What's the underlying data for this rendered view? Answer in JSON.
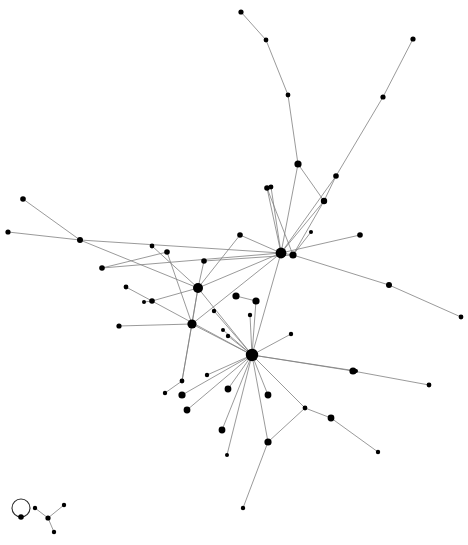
{
  "figure": {
    "type": "node-link-diagram",
    "width": 468,
    "height": 545,
    "background_color": "#ffffff",
    "node_color": "#000000",
    "edge_color": "#808080",
    "selfloop_color": "#2b2b2b",
    "edge_width": 0.8,
    "node_count": 60,
    "edge_count": 66,
    "component_count": 3,
    "layout": "force-directed"
  },
  "chart_data": {
    "type": "scatter",
    "xlabel": "",
    "ylabel": "",
    "xlim": [
      0,
      468
    ],
    "ylim": [
      0,
      545
    ],
    "grid": false,
    "legend": "none",
    "nodes": [
      {
        "id": "n0",
        "x": 241,
        "y": 12,
        "r": 2.6,
        "degree": 1
      },
      {
        "id": "n1",
        "x": 266,
        "y": 40,
        "r": 2.4,
        "degree": 2
      },
      {
        "id": "n2",
        "x": 288,
        "y": 95,
        "r": 2.4,
        "degree": 2
      },
      {
        "id": "n3",
        "x": 298,
        "y": 164,
        "r": 3.6,
        "degree": 3
      },
      {
        "id": "n4",
        "x": 413,
        "y": 39,
        "r": 2.6,
        "degree": 1
      },
      {
        "id": "n5",
        "x": 383,
        "y": 97,
        "r": 2.6,
        "degree": 2
      },
      {
        "id": "n6",
        "x": 336,
        "y": 176,
        "r": 2.8,
        "degree": 2
      },
      {
        "id": "n7",
        "x": 324,
        "y": 201,
        "r": 3.2,
        "degree": 3
      },
      {
        "id": "n8",
        "x": 267,
        "y": 188,
        "r": 2.8,
        "degree": 2
      },
      {
        "id": "n9",
        "x": 281,
        "y": 253,
        "r": 5.4,
        "degree": 9
      },
      {
        "id": "n10",
        "x": 293,
        "y": 255,
        "r": 3.6,
        "degree": 4
      },
      {
        "id": "n11",
        "x": 240,
        "y": 235,
        "r": 2.8,
        "degree": 2
      },
      {
        "id": "n12",
        "x": 360,
        "y": 235,
        "r": 2.8,
        "degree": 1
      },
      {
        "id": "n13",
        "x": 389,
        "y": 285,
        "r": 3.0,
        "degree": 2
      },
      {
        "id": "n14",
        "x": 461,
        "y": 317,
        "r": 2.4,
        "degree": 1
      },
      {
        "id": "n15",
        "x": 23,
        "y": 199,
        "r": 2.8,
        "degree": 1
      },
      {
        "id": "n16",
        "x": 8,
        "y": 232,
        "r": 2.6,
        "degree": 1
      },
      {
        "id": "n17",
        "x": 80,
        "y": 240,
        "r": 3.0,
        "degree": 3
      },
      {
        "id": "n18",
        "x": 102,
        "y": 268,
        "r": 2.8,
        "degree": 2
      },
      {
        "id": "n19",
        "x": 152,
        "y": 246,
        "r": 2.4,
        "degree": 1
      },
      {
        "id": "n20",
        "x": 167,
        "y": 252,
        "r": 2.8,
        "degree": 2
      },
      {
        "id": "n21",
        "x": 204,
        "y": 261,
        "r": 2.8,
        "degree": 2
      },
      {
        "id": "n22",
        "x": 198,
        "y": 288,
        "r": 5.0,
        "degree": 8
      },
      {
        "id": "n23",
        "x": 126,
        "y": 287,
        "r": 2.4,
        "degree": 1
      },
      {
        "id": "n24",
        "x": 152,
        "y": 301,
        "r": 2.8,
        "degree": 3
      },
      {
        "id": "n25",
        "x": 119,
        "y": 326,
        "r": 2.6,
        "degree": 1
      },
      {
        "id": "n26",
        "x": 192,
        "y": 324,
        "r": 4.6,
        "degree": 5
      },
      {
        "id": "n27",
        "x": 236,
        "y": 296,
        "r": 3.6,
        "degree": 1
      },
      {
        "id": "n28",
        "x": 256,
        "y": 301,
        "r": 3.6,
        "degree": 2
      },
      {
        "id": "n29",
        "x": 250,
        "y": 315,
        "r": 2.2,
        "degree": 1
      },
      {
        "id": "n30",
        "x": 252,
        "y": 355,
        "r": 6.2,
        "degree": 17
      },
      {
        "id": "n31",
        "x": 228,
        "y": 336,
        "r": 2.2,
        "degree": 1
      },
      {
        "id": "n32",
        "x": 223,
        "y": 330,
        "r": 2.0,
        "degree": 1
      },
      {
        "id": "n33",
        "x": 291,
        "y": 334,
        "r": 2.2,
        "degree": 1
      },
      {
        "id": "n34",
        "x": 353,
        "y": 371,
        "r": 3.6,
        "degree": 2
      },
      {
        "id": "n35",
        "x": 429,
        "y": 385,
        "r": 2.4,
        "degree": 1
      },
      {
        "id": "n36",
        "x": 182,
        "y": 381,
        "r": 2.4,
        "degree": 2
      },
      {
        "id": "n37",
        "x": 165,
        "y": 393,
        "r": 2.2,
        "degree": 1
      },
      {
        "id": "n38",
        "x": 182,
        "y": 395,
        "r": 3.6,
        "degree": 1
      },
      {
        "id": "n39",
        "x": 187,
        "y": 410,
        "r": 3.4,
        "degree": 1
      },
      {
        "id": "n40",
        "x": 222,
        "y": 430,
        "r": 3.4,
        "degree": 1
      },
      {
        "id": "n41",
        "x": 228,
        "y": 389,
        "r": 3.4,
        "degree": 1
      },
      {
        "id": "n42",
        "x": 268,
        "y": 395,
        "r": 3.4,
        "degree": 1
      },
      {
        "id": "n43",
        "x": 268,
        "y": 442,
        "r": 3.6,
        "degree": 3
      },
      {
        "id": "n44",
        "x": 305,
        "y": 408,
        "r": 2.4,
        "degree": 2
      },
      {
        "id": "n45",
        "x": 331,
        "y": 418,
        "r": 3.4,
        "degree": 2
      },
      {
        "id": "n46",
        "x": 378,
        "y": 452,
        "r": 2.2,
        "degree": 1
      },
      {
        "id": "n47",
        "x": 243,
        "y": 508,
        "r": 2.2,
        "degree": 1
      },
      {
        "id": "n48",
        "x": 207,
        "y": 375,
        "r": 2.2,
        "degree": 1
      },
      {
        "id": "n49",
        "x": 214,
        "y": 311,
        "r": 2.2,
        "degree": 1
      },
      {
        "id": "n50",
        "x": 144,
        "y": 302,
        "r": 2.0,
        "degree": 1
      },
      {
        "id": "n51",
        "x": 271,
        "y": 187,
        "r": 2.4,
        "degree": 1
      },
      {
        "id": "n52",
        "x": 311,
        "y": 232,
        "r": 2.0,
        "degree": 1
      },
      {
        "id": "n53",
        "x": 356,
        "y": 371,
        "r": 2.0,
        "degree": 1
      },
      {
        "id": "n54",
        "x": 21,
        "y": 517,
        "r": 2.8,
        "degree": 2
      },
      {
        "id": "n55",
        "x": 48,
        "y": 518,
        "r": 2.6,
        "degree": 3
      },
      {
        "id": "n56",
        "x": 35,
        "y": 508,
        "r": 2.2,
        "degree": 1
      },
      {
        "id": "n57",
        "x": 64,
        "y": 505,
        "r": 2.2,
        "degree": 1
      },
      {
        "id": "n58",
        "x": 54,
        "y": 532,
        "r": 2.2,
        "degree": 1
      },
      {
        "id": "n59",
        "x": 227,
        "y": 455,
        "r": 2.0,
        "degree": 1
      }
    ],
    "edges": [
      {
        "source": "n0",
        "target": "n1"
      },
      {
        "source": "n1",
        "target": "n2"
      },
      {
        "source": "n2",
        "target": "n3"
      },
      {
        "source": "n3",
        "target": "n9"
      },
      {
        "source": "n3",
        "target": "n7"
      },
      {
        "source": "n4",
        "target": "n5"
      },
      {
        "source": "n5",
        "target": "n6"
      },
      {
        "source": "n6",
        "target": "n7"
      },
      {
        "source": "n6",
        "target": "n9"
      },
      {
        "source": "n7",
        "target": "n9"
      },
      {
        "source": "n7",
        "target": "n10"
      },
      {
        "source": "n8",
        "target": "n9"
      },
      {
        "source": "n8",
        "target": "n10"
      },
      {
        "source": "n9",
        "target": "n10"
      },
      {
        "source": "n9",
        "target": "n11"
      },
      {
        "source": "n9",
        "target": "n17"
      },
      {
        "source": "n9",
        "target": "n22"
      },
      {
        "source": "n9",
        "target": "n26"
      },
      {
        "source": "n9",
        "target": "n30"
      },
      {
        "source": "n10",
        "target": "n13"
      },
      {
        "source": "n10",
        "target": "n21"
      },
      {
        "source": "n13",
        "target": "n14"
      },
      {
        "source": "n11",
        "target": "n22"
      },
      {
        "source": "n12",
        "target": "n9"
      },
      {
        "source": "n15",
        "target": "n17"
      },
      {
        "source": "n16",
        "target": "n17"
      },
      {
        "source": "n17",
        "target": "n22"
      },
      {
        "source": "n18",
        "target": "n20"
      },
      {
        "source": "n18",
        "target": "n9"
      },
      {
        "source": "n19",
        "target": "n22"
      },
      {
        "source": "n20",
        "target": "n26"
      },
      {
        "source": "n21",
        "target": "n22"
      },
      {
        "source": "n22",
        "target": "n24"
      },
      {
        "source": "n22",
        "target": "n26"
      },
      {
        "source": "n22",
        "target": "n30"
      },
      {
        "source": "n22",
        "target": "n36"
      },
      {
        "source": "n23",
        "target": "n24"
      },
      {
        "source": "n24",
        "target": "n30"
      },
      {
        "source": "n25",
        "target": "n26"
      },
      {
        "source": "n26",
        "target": "n30"
      },
      {
        "source": "n26",
        "target": "n36"
      },
      {
        "source": "n27",
        "target": "n28"
      },
      {
        "source": "n28",
        "target": "n30"
      },
      {
        "source": "n29",
        "target": "n30"
      },
      {
        "source": "n30",
        "target": "n31"
      },
      {
        "source": "n30",
        "target": "n32"
      },
      {
        "source": "n30",
        "target": "n33"
      },
      {
        "source": "n30",
        "target": "n34"
      },
      {
        "source": "n30",
        "target": "n38"
      },
      {
        "source": "n30",
        "target": "n39"
      },
      {
        "source": "n30",
        "target": "n40"
      },
      {
        "source": "n30",
        "target": "n41"
      },
      {
        "source": "n30",
        "target": "n42"
      },
      {
        "source": "n30",
        "target": "n43"
      },
      {
        "source": "n30",
        "target": "n44"
      },
      {
        "source": "n30",
        "target": "n48"
      },
      {
        "source": "n30",
        "target": "n49"
      },
      {
        "source": "n30",
        "target": "n59"
      },
      {
        "source": "n34",
        "target": "n35"
      },
      {
        "source": "n36",
        "target": "n37"
      },
      {
        "source": "n43",
        "target": "n44"
      },
      {
        "source": "n43",
        "target": "n47"
      },
      {
        "source": "n44",
        "target": "n45"
      },
      {
        "source": "n45",
        "target": "n46"
      },
      {
        "source": "n50",
        "target": "n24"
      },
      {
        "source": "n51",
        "target": "n9"
      },
      {
        "source": "n52",
        "target": "n10"
      },
      {
        "source": "n53",
        "target": "n30"
      },
      {
        "source": "n55",
        "target": "n56"
      },
      {
        "source": "n55",
        "target": "n57"
      },
      {
        "source": "n55",
        "target": "n58"
      }
    ],
    "self_loops": [
      {
        "node": "n54",
        "cx": 21,
        "cy": 508,
        "r": 9
      }
    ],
    "components": [
      {
        "name": "main-component",
        "node_count": 54
      },
      {
        "name": "selfloop-component",
        "node_count": 1
      },
      {
        "name": "star-component",
        "node_count": 4
      }
    ]
  }
}
